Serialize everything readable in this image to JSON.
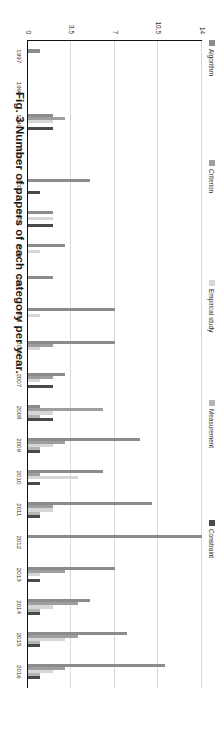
{
  "figure": {
    "caption": "Fig. 3  Number of papers of each category per year."
  },
  "chart_data": {
    "type": "bar",
    "orientation": "vertical-grouped",
    "title": "",
    "xlabel": "",
    "ylabel": "",
    "ylim": [
      0,
      14
    ],
    "yticks": [
      "0",
      "3.5",
      "7",
      "10.5",
      "14"
    ],
    "ytick_values": [
      0,
      3.5,
      7,
      10.5,
      14
    ],
    "grid": true,
    "legend_position": "top",
    "categories": [
      "1997",
      "1998",
      "1999",
      "2000",
      "2001",
      "2002",
      "2003",
      "2004",
      "2005",
      "2006",
      "2007",
      "2008",
      "2009",
      "2010",
      "2011",
      "2012",
      "2013",
      "2014",
      "2015",
      "2016"
    ],
    "series": [
      {
        "name": "Algorithm",
        "color": "#8c8c8c",
        "values": [
          1,
          0,
          2,
          0,
          5,
          2,
          3,
          2,
          7,
          7,
          3,
          1,
          9,
          6,
          10,
          14,
          7,
          5,
          8,
          11
        ]
      },
      {
        "name": "Criterion",
        "color": "#9e9e9e",
        "values": [
          0,
          0,
          3,
          0,
          0,
          0,
          0,
          0,
          0,
          2,
          2,
          6,
          3,
          1,
          2,
          0,
          3,
          4,
          4,
          3
        ]
      },
      {
        "name": "Empirical study",
        "color": "#d6d6d6",
        "values": [
          0,
          0,
          2,
          0,
          0,
          2,
          1,
          0,
          1,
          1,
          1,
          2,
          2,
          4,
          2,
          0,
          1,
          2,
          3,
          2
        ]
      },
      {
        "name": "Measurement",
        "color": "#b5b5b5",
        "values": [
          0,
          0,
          0,
          0,
          0,
          0,
          0,
          0,
          0,
          0,
          0,
          1,
          1,
          0,
          1,
          0,
          0,
          1,
          1,
          1
        ]
      },
      {
        "name": "Constraint",
        "color": "#4a4a4a",
        "values": [
          0,
          0,
          2,
          0,
          1,
          2,
          0,
          0,
          0,
          0,
          2,
          2,
          1,
          1,
          1,
          0,
          1,
          1,
          1,
          1
        ]
      }
    ]
  }
}
